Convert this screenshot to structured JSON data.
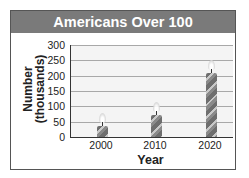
{
  "chart_data": {
    "type": "bar",
    "title": "Americans Over 100",
    "xlabel": "Year",
    "ylabel": "Number (thousands)",
    "ylabel_lines": [
      "Number",
      "(thousands)"
    ],
    "categories": [
      "2000",
      "2010",
      "2020"
    ],
    "values": [
      37,
      72,
      208
    ],
    "ylim": [
      0,
      300
    ],
    "yticks": [
      0,
      50,
      100,
      150,
      200,
      250,
      300
    ],
    "yticks_labels": [
      "0",
      "50",
      "100",
      "150",
      "200",
      "250",
      "300"
    ],
    "grid": true,
    "legend": null,
    "bar_style": "candles with flames (pictograph)"
  },
  "colors": {
    "title_bar": "#7a7a7a",
    "title_text": "#ffffff",
    "plot_background": "#f4f4f4",
    "gridline": "#a8a8a8",
    "candle": "#7a7a7a"
  }
}
